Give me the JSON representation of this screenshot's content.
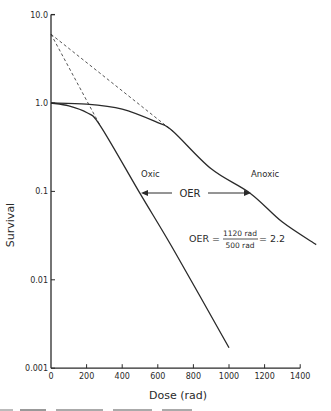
{
  "chart_data": {
    "type": "line",
    "title": "",
    "xlabel": "Dose (rad)",
    "ylabel": "Survival",
    "xscale": "linear",
    "yscale": "log",
    "xlim": [
      0,
      1400
    ],
    "ylim": [
      0.001,
      10.0
    ],
    "x_ticks": [
      0,
      200,
      400,
      600,
      800,
      1000,
      1200,
      1400
    ],
    "x_tick_labels": [
      "0",
      "200",
      "400",
      "600",
      "800",
      "1000",
      "1200",
      "1400"
    ],
    "y_ticks": [
      10.0,
      1.0,
      0.1,
      0.01,
      0.001
    ],
    "y_tick_labels": [
      "10.0",
      "1.0",
      "0.1",
      "0.01",
      "0.001"
    ],
    "grid": false,
    "legend": null,
    "series": [
      {
        "name": "Oxic",
        "style": "solid",
        "points": [
          [
            0,
            1.0
          ],
          [
            100,
            0.93
          ],
          [
            200,
            0.78
          ],
          [
            275,
            0.56
          ],
          [
            500,
            0.095
          ],
          [
            700,
            0.02
          ],
          [
            1000,
            0.0017
          ]
        ]
      },
      {
        "name": "Anoxic",
        "style": "solid",
        "points": [
          [
            0,
            1.0
          ],
          [
            200,
            0.97
          ],
          [
            400,
            0.85
          ],
          [
            600,
            0.6
          ],
          [
            685,
            0.48
          ],
          [
            900,
            0.18
          ],
          [
            1120,
            0.095
          ],
          [
            1300,
            0.045
          ],
          [
            1490,
            0.025
          ]
        ]
      },
      {
        "name": "Oxic extrapolation",
        "style": "dashed",
        "points": [
          [
            0,
            6.0
          ],
          [
            275,
            0.56
          ]
        ]
      },
      {
        "name": "Anoxic extrapolation",
        "style": "dashed",
        "points": [
          [
            0,
            6.0
          ],
          [
            685,
            0.48
          ]
        ]
      }
    ],
    "annotations": [
      {
        "text": "Oxic",
        "x": 520,
        "y": 0.16
      },
      {
        "text": "Anoxic",
        "x": 1130,
        "y": 0.16
      },
      {
        "text": "OER",
        "type": "double-arrow",
        "x_from": 500,
        "x_to": 1120,
        "y": 0.1
      },
      {
        "text": "OER = 1120 rad / 500 rad = 2.2",
        "x": 920,
        "y": 0.03
      }
    ],
    "extrapolation_number": 6.0,
    "oer_value": 2.2,
    "oer_numerator": "1120 rad",
    "oer_denominator": "500 rad"
  },
  "labels": {
    "y_axis": "Survival",
    "x_axis": "Dose (rad)",
    "oxic": "Oxic",
    "anoxic": "Anoxic",
    "oer_arrow": "OER",
    "oer_formula_lhs": "OER =",
    "oer_numerator": "1120 rad",
    "oer_denominator": "500 rad",
    "oer_result": "= 2.2"
  },
  "colors": {
    "ink": "#2a2a2a",
    "background": "#ffffff"
  }
}
